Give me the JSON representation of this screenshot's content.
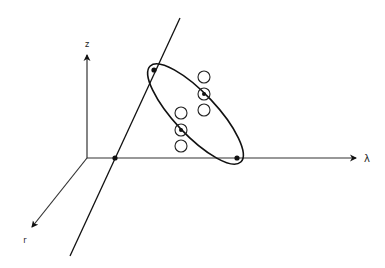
{
  "diagram": {
    "type": "3d-axes-with-ellipse",
    "stroke_color": "#111111",
    "background": "#ffffff",
    "axes": {
      "z": {
        "label": "z",
        "from": [
          87,
          158
        ],
        "to": [
          87,
          55
        ],
        "label_pos": [
          87,
          47
        ]
      },
      "lambda": {
        "label": "λ",
        "from": [
          87,
          158
        ],
        "to": [
          356,
          158
        ],
        "label_pos": [
          367,
          162
        ]
      },
      "r": {
        "label": "r",
        "from": [
          87,
          158
        ],
        "to": [
          32,
          227
        ],
        "label_pos": [
          25,
          243
        ]
      }
    },
    "line": {
      "from": [
        180,
        18
      ],
      "to": [
        70,
        256
      ]
    },
    "points": [
      {
        "name": "line-lambda-intersection",
        "x": 115,
        "y": 158
      },
      {
        "name": "ellipse-top-point",
        "x": 154,
        "y": 70
      },
      {
        "name": "ellipse-bottom-point",
        "x": 237,
        "y": 158
      }
    ],
    "ellipse": {
      "cx": 195.5,
      "cy": 114,
      "rx": 66,
      "ry": 21,
      "rotate": 46.7
    },
    "circles": [
      {
        "x": 204,
        "y": 77,
        "marked": false
      },
      {
        "x": 204,
        "y": 94,
        "marked": true
      },
      {
        "x": 204,
        "y": 110,
        "marked": false
      },
      {
        "x": 181,
        "y": 113,
        "marked": false
      },
      {
        "x": 181,
        "y": 130,
        "marked": true
      },
      {
        "x": 181,
        "y": 146,
        "marked": false
      }
    ],
    "circle_radius": 6
  }
}
